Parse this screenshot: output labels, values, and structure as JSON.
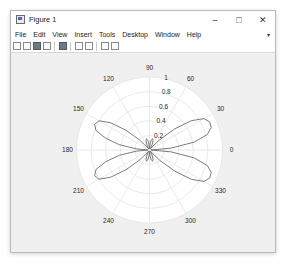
{
  "window": {
    "title": "Figure 1",
    "controls": {
      "minimize": "–",
      "maximize": "□",
      "close": "✕"
    }
  },
  "menubar": {
    "items": [
      "File",
      "Edit",
      "View",
      "Insert",
      "Tools",
      "Desktop",
      "Window",
      "Help"
    ],
    "overflow": "▾"
  },
  "toolbar": {
    "buttons": [
      {
        "icon": "new-figure-icon"
      },
      {
        "icon": "open-file-icon"
      },
      {
        "icon": "save-icon"
      },
      {
        "icon": "print-icon"
      },
      {
        "icon": "link-plot-icon"
      },
      {
        "icon": "insert-colorbar-icon"
      },
      {
        "icon": "insert-legend-icon"
      },
      {
        "icon": "edit-plot-icon"
      },
      {
        "icon": "open-property-inspector-icon"
      }
    ]
  },
  "chart_data": {
    "type": "polar-line",
    "title": "",
    "theta_ticks_deg": [
      0,
      30,
      60,
      90,
      120,
      150,
      180,
      210,
      240,
      270,
      300,
      330
    ],
    "theta_tick_labels": [
      "0",
      "30",
      "60",
      "90",
      "120",
      "150",
      "180",
      "210",
      "240",
      "270",
      "300",
      "330"
    ],
    "r_ticks": [
      0.2,
      0.4,
      0.6,
      0.8,
      1
    ],
    "r_tick_labels": [
      "0.2",
      "0.4",
      "0.6",
      "0.8",
      "1"
    ],
    "rlim": [
      0,
      1
    ],
    "grid": true,
    "line_color": "#5a5a5a",
    "series": [
      {
        "name": "r(theta)",
        "theta_deg": [
          0,
          5,
          10,
          15,
          20,
          25,
          30,
          35,
          40,
          45,
          50,
          55,
          60,
          65,
          70,
          75,
          80,
          85,
          90,
          95,
          100,
          105,
          110,
          115,
          120,
          125,
          130,
          135,
          140,
          145,
          150,
          155,
          160,
          165,
          170,
          175,
          180,
          185,
          190,
          195,
          200,
          205,
          210,
          215,
          220,
          225,
          230,
          235,
          240,
          245,
          250,
          255,
          260,
          265,
          270,
          275,
          280,
          285,
          290,
          295,
          300,
          305,
          310,
          315,
          320,
          325,
          330,
          335,
          340,
          345,
          350,
          355,
          360
        ],
        "r": [
          0.02,
          0.3,
          0.62,
          0.82,
          0.9,
          0.91,
          0.86,
          0.7,
          0.45,
          0.2,
          0.05,
          0.02,
          0.04,
          0.09,
          0.14,
          0.16,
          0.14,
          0.08,
          0.02,
          0.08,
          0.14,
          0.16,
          0.14,
          0.09,
          0.04,
          0.02,
          0.05,
          0.2,
          0.42,
          0.65,
          0.8,
          0.83,
          0.78,
          0.62,
          0.42,
          0.18,
          0.02,
          0.18,
          0.42,
          0.62,
          0.78,
          0.83,
          0.8,
          0.65,
          0.42,
          0.2,
          0.05,
          0.02,
          0.04,
          0.09,
          0.14,
          0.16,
          0.14,
          0.08,
          0.02,
          0.08,
          0.14,
          0.16,
          0.14,
          0.09,
          0.04,
          0.02,
          0.05,
          0.2,
          0.45,
          0.7,
          0.86,
          0.91,
          0.9,
          0.82,
          0.62,
          0.3,
          0.02
        ]
      }
    ]
  },
  "colors": {
    "window_bg": "#f0f0f0",
    "plot_bg": "#ffffff",
    "grid": "#e3e3e3",
    "text": "#262626"
  }
}
